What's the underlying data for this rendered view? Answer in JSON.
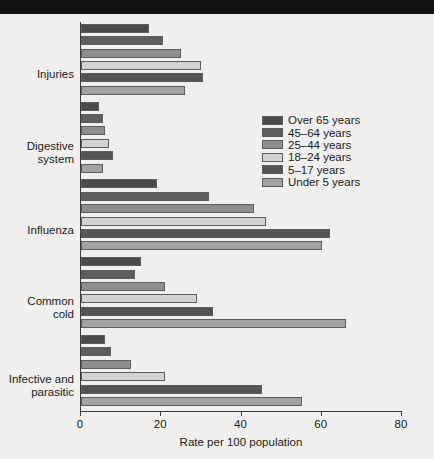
{
  "chart_data": {
    "type": "bar",
    "orientation": "horizontal",
    "title": "",
    "xlabel": "Rate per 100 population",
    "ylabel": "",
    "xlim": [
      0,
      80
    ],
    "xticks": [
      0,
      20,
      40,
      60,
      80
    ],
    "grid": false,
    "legend_position": "center-right",
    "categories": [
      "Injuries",
      "Digestive\nsystem",
      "Influenza",
      "Common\ncold",
      "Infective and\nparasitic"
    ],
    "series": [
      {
        "name": "Over 65 years",
        "color": "#4a4a4a",
        "values": [
          17.0,
          4.5,
          19.0,
          15.0,
          6.0
        ]
      },
      {
        "name": "45–64 years",
        "color": "#5e5e5e",
        "values": [
          20.5,
          5.5,
          32.0,
          13.5,
          7.5
        ]
      },
      {
        "name": "25–44 years",
        "color": "#8e8e8e",
        "values": [
          25.0,
          6.0,
          43.0,
          21.0,
          12.5
        ]
      },
      {
        "name": "18–24 years",
        "color": "#d2d2d2",
        "values": [
          30.0,
          7.0,
          46.0,
          29.0,
          21.0
        ]
      },
      {
        "name": "5–17 years",
        "color": "#545454",
        "values": [
          30.5,
          8.0,
          62.0,
          33.0,
          45.0
        ]
      },
      {
        "name": "Under 5 years",
        "color": "#a2a2a2",
        "values": [
          26.0,
          5.5,
          60.0,
          66.0,
          55.0
        ]
      }
    ]
  },
  "legend": {
    "items": [
      "Over 65 years",
      "45–64 years",
      "25–44 years",
      "18–24 years",
      "5–17 years",
      "Under 5 years"
    ]
  },
  "axis": {
    "x_tick_labels": [
      "0",
      "20",
      "40",
      "60",
      "80"
    ],
    "x_title": "Rate per 100 population"
  }
}
